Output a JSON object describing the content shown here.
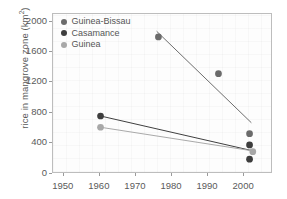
{
  "chart_data": {
    "type": "scatter",
    "title": "",
    "xlabel": "",
    "ylabel": "rice in mangrove zone (km",
    "ylabel_sup": "2",
    "ylabel_suffix": ")",
    "xlim": [
      1947,
      2008
    ],
    "ylim": [
      0,
      2100
    ],
    "grid": true,
    "legend_position": "top-left",
    "xticks": [
      1950,
      1960,
      1970,
      1980,
      1990,
      2000
    ],
    "yticks": [
      0,
      400,
      800,
      1200,
      1600,
      2000
    ],
    "series": [
      {
        "name": "Guinea-Bissau",
        "color": "#6b6b6b",
        "points": [
          {
            "x": 1976.5,
            "y": 1795
          },
          {
            "x": 1993.3,
            "y": 1305
          },
          {
            "x": 2002.0,
            "y": 505
          }
        ],
        "trendline": {
          "x1": 1976.0,
          "y1": 1870,
          "x2": 2002.5,
          "y2": 650
        }
      },
      {
        "name": "Casamance",
        "color": "#3d3d3d",
        "points": [
          {
            "x": 1960.3,
            "y": 740
          },
          {
            "x": 2002.0,
            "y": 355
          },
          {
            "x": 2002.0,
            "y": 165
          }
        ],
        "trendline": {
          "x1": 1960.3,
          "y1": 740,
          "x2": 2002.5,
          "y2": 280
        }
      },
      {
        "name": "Guinea",
        "color": "#a8a8a8",
        "points": [
          {
            "x": 1960.3,
            "y": 590
          },
          {
            "x": 2002.9,
            "y": 265
          }
        ],
        "trendline": {
          "x1": 1960.3,
          "y1": 590,
          "x2": 2002.9,
          "y2": 275
        }
      }
    ]
  },
  "legend": {
    "items": [
      {
        "label": "Guinea-Bissau",
        "color": "#6b6b6b"
      },
      {
        "label": "Casamance",
        "color": "#3d3d3d"
      },
      {
        "label": "Guinea",
        "color": "#a8a8a8"
      }
    ]
  },
  "axes": {
    "y_tick_labels": [
      "2000",
      "1600",
      "1200",
      "800",
      "400",
      "0"
    ],
    "x_tick_labels": [
      "1950",
      "1960",
      "1970",
      "1980",
      "1990",
      "2000"
    ]
  }
}
